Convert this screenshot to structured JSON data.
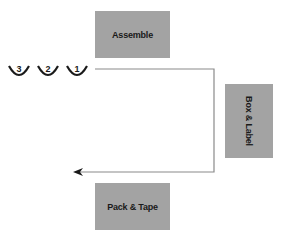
{
  "diagram": {
    "stations": [
      {
        "id": "assemble",
        "label": "Assemble"
      },
      {
        "id": "box-label",
        "label": "Box & Label"
      },
      {
        "id": "pack-tape",
        "label": "Pack & Tape"
      }
    ],
    "queue": [
      {
        "label": "3"
      },
      {
        "label": "2"
      },
      {
        "label": "1"
      }
    ],
    "colors": {
      "station_fill": "#a3a3a3",
      "line": "#8a8a8a",
      "text": "#1a1a1a"
    }
  }
}
